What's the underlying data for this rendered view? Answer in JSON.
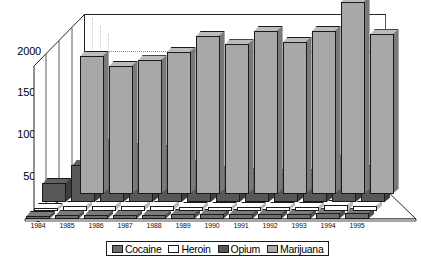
{
  "chart_data": {
    "type": "bar",
    "title": "",
    "subtitle": "",
    "xlabel": "",
    "ylabel": "",
    "ylim": [
      0,
      2500
    ],
    "yticks": [
      0,
      500,
      1000,
      1500,
      2000
    ],
    "ytick_labels": [
      "0",
      "500",
      "1000",
      "1500",
      "2000"
    ],
    "grid": true,
    "gridlines_at": [
      2000
    ],
    "legend_position": "bottom",
    "projection": "3d",
    "categories": [
      "1984",
      "1985",
      "1986",
      "1987",
      "1988",
      "1989",
      "1990",
      "1991",
      "1992",
      "1993",
      "1994",
      "1995"
    ],
    "series": [
      {
        "name": "Cocaine",
        "color": "#6e6e6e",
        "depth_index": 3,
        "values": [
          40,
          45,
          45,
          45,
          45,
          60,
          60,
          60,
          60,
          60,
          70,
          70
        ]
      },
      {
        "name": "Heroin",
        "color": "#ffffff",
        "depth_index": 2,
        "values": [
          35,
          60,
          60,
          60,
          60,
          45,
          45,
          45,
          45,
          45,
          70,
          60
        ]
      },
      {
        "name": "Opium",
        "color": "#575757",
        "depth_index": 1,
        "values": [
          230,
          440,
          700,
          650,
          630,
          440,
          370,
          350,
          340,
          340,
          500,
          390
        ]
      },
      {
        "name": "Marijuana",
        "color": "#a8a8a8",
        "depth_index": 0,
        "values": [
          0,
          1650,
          1530,
          1600,
          1700,
          1890,
          1790,
          1950,
          1820,
          1950,
          2300,
          1910
        ]
      }
    ]
  },
  "legend": {
    "items": [
      {
        "label": "Cocaine",
        "swatch": "#6e6e6e"
      },
      {
        "label": "Heroin",
        "swatch": "#ffffff"
      },
      {
        "label": "Opium",
        "swatch": "#575757"
      },
      {
        "label": "Marijuana",
        "swatch": "#a8a8a8"
      }
    ]
  },
  "axes": {
    "y_tick_labels": [
      "2000",
      "1500",
      "1000",
      "500",
      "0"
    ],
    "x_tick_labels": [
      "1984",
      "1985",
      "1986",
      "1987",
      "1988",
      "1989",
      "1990",
      "1991",
      "1992",
      "1993",
      "1994",
      "1995"
    ]
  },
  "colors": {
    "axis": "#111111",
    "grid": "#8a8a8a",
    "background": "#ffffff",
    "outline": "#1a1a1a"
  }
}
